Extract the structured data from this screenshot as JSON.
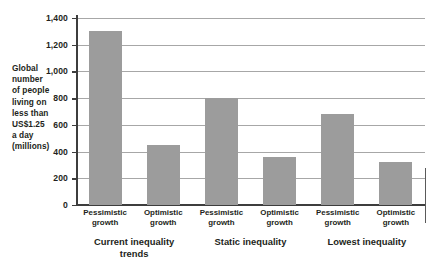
{
  "chart_data": {
    "type": "bar",
    "title": "",
    "subtitle": "",
    "xlabel": "",
    "ylabel": "Global number of people living on less than US$1.25 a day (millions)",
    "ylim": [
      0,
      1400
    ],
    "ytick_labels": [
      "0",
      "200",
      "400",
      "600",
      "800",
      "1,000",
      "1,200",
      "1,400"
    ],
    "ytick_values": [
      0,
      200,
      400,
      600,
      800,
      1000,
      1200,
      1400
    ],
    "grid": true,
    "legend": "none",
    "bar_color": "#9c9c9c",
    "axis_color": "#3d3d3d",
    "gridline_color": "#a7a7a7",
    "categories": [
      "Pessimistic growth",
      "Optimistic growth",
      "Pessimistic growth",
      "Optimistic growth",
      "Pessimistic growth",
      "Optimistic growth"
    ],
    "category_lines": [
      [
        "Pessimistic",
        "growth"
      ],
      [
        "Optimistic",
        "growth"
      ],
      [
        "Pessimistic",
        "growth"
      ],
      [
        "Optimistic",
        "growth"
      ],
      [
        "Pessimistic",
        "growth"
      ],
      [
        "Optimistic",
        "growth"
      ]
    ],
    "values": [
      1300,
      450,
      800,
      360,
      680,
      320
    ],
    "groups": [
      {
        "label": "Current inequality trends",
        "lines": [
          "Current inequality",
          "trends"
        ],
        "categories": [
          0,
          1
        ]
      },
      {
        "label": "Static inequality",
        "lines": [
          "Static inequality"
        ],
        "categories": [
          2,
          3
        ]
      },
      {
        "label": "Lowest inequality",
        "lines": [
          "Lowest inequality"
        ],
        "categories": [
          4,
          5
        ]
      }
    ]
  },
  "axis_caption": {
    "lines": [
      "Global",
      "number",
      "of people",
      "living on",
      "less than",
      "US$1.25",
      "a day",
      "(millions)"
    ]
  }
}
